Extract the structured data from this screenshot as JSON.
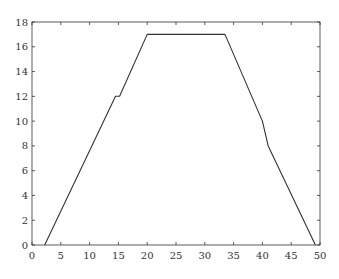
{
  "chart_data": {
    "type": "line",
    "title": "",
    "xlabel": "",
    "ylabel": "",
    "xlim": [
      0,
      50
    ],
    "ylim": [
      0,
      18
    ],
    "grid": false,
    "legend": null,
    "x_ticks": [
      0,
      5,
      10,
      15,
      20,
      25,
      30,
      35,
      40,
      45,
      50
    ],
    "y_ticks": [
      0,
      2,
      4,
      6,
      8,
      10,
      12,
      14,
      16,
      18
    ],
    "series": [
      {
        "name": "trace",
        "color": "#333333",
        "x": [
          2.2,
          14.5,
          15.2,
          20.0,
          33.5,
          40.0,
          41.0,
          49.2
        ],
        "y": [
          0,
          12,
          12,
          17,
          17,
          10,
          8,
          0
        ]
      }
    ]
  },
  "colors": {
    "axis": "#333333",
    "line": "#333333",
    "background": "#ffffff"
  }
}
